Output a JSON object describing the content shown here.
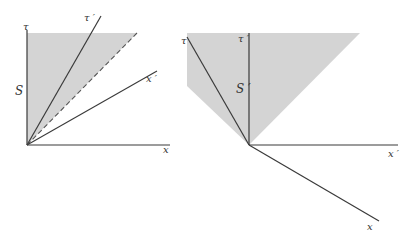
{
  "colors": {
    "shade": "#d4d4d4",
    "line": "#3a3a3a",
    "background": "#ffffff"
  },
  "left_diagram": {
    "frame": "S",
    "axes": {
      "tau": "τ",
      "x": "x",
      "tau_prime": "τ ′",
      "x_prime": "x ′"
    },
    "frame_label": "S",
    "light_cone_edge": "dashed"
  },
  "right_diagram": {
    "frame": "S′",
    "axes": {
      "tau": "τ",
      "x": "x",
      "tau_prime": "τ ′",
      "x_prime": "x ′"
    },
    "frame_label": "S ′"
  }
}
